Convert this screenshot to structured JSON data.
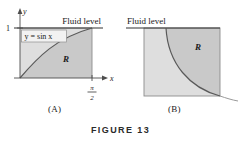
{
  "figure": {
    "label": "FIGURE 13",
    "panels": [
      {
        "id": "A",
        "caption": "(A)",
        "fluid_level_label": "Fluid level",
        "equation_label": "y = sin x",
        "region_label": "R",
        "y_axis_label": "y",
        "x_axis_label": "x",
        "y_tick_label": "1",
        "x_tick_numerator": "π",
        "x_tick_denominator": "2"
      },
      {
        "id": "B",
        "caption": "(B)",
        "fluid_level_label": "Fluid level",
        "region_label": "R"
      }
    ]
  },
  "colors": {
    "region_shade": "#c9c9c9",
    "upper_shade": "#dedede",
    "curve_stroke": "#595959",
    "axis_stroke": "#4d4d4d",
    "box_stroke": "#8c8c8c",
    "text": "#1a1a1a",
    "background": "#ffffff"
  }
}
